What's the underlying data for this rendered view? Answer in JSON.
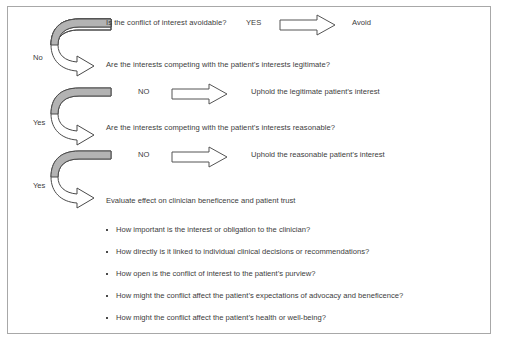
{
  "figure": {
    "type": "decision-flowchart",
    "title_visible": false,
    "border_color": "#a8a8a8",
    "text_color": "#3c3c3c",
    "arrow_fill_gray": "#b3b3b3",
    "arrow_outline": "#4a4a4a"
  },
  "decision_steps": [
    {
      "question": "Is the conflict of interest avoidable?",
      "branch_label": "YES",
      "outcome": "Avoid",
      "side_label": "No"
    },
    {
      "question": "Are the interests competing with the patient’s interests legitimate?",
      "branch_label": "NO",
      "outcome": "Uphold the legitimate patient’s interest",
      "side_label": "Yes"
    },
    {
      "question": "Are the interests competing with the patient’s interests reasonable?",
      "branch_label": "NO",
      "outcome": "Uphold the reasonable patient’s interest",
      "side_label": "Yes"
    }
  ],
  "final_section": {
    "heading": "Evaluate effect on clinician beneficence and patient trust",
    "bullets": [
      "How important is the interest or obligation to the clinician?",
      "How directly is it linked to individual clinical decisions or recommendations?",
      "How open is the conflict of interest to the patient’s purview?",
      "How might the conflict affect the patient’s expectations of advocacy and beneficence?",
      "How might the conflict affect the patient’s health or well-being?"
    ]
  },
  "icons": {
    "curved_loop_arrow": "curved-loop-arrow-icon",
    "block_arrow_right": "block-arrow-right-icon"
  }
}
